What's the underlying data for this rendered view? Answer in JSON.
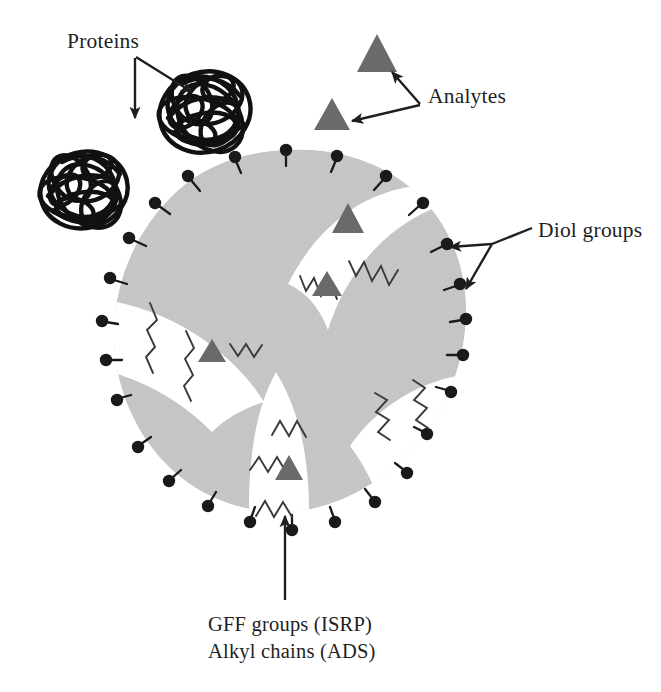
{
  "figure": {
    "background_color": "#ffffff"
  },
  "labels": {
    "proteins": "Proteins",
    "analytes": "Analytes",
    "diol_groups": "Diol groups",
    "gff_groups": "GFF groups (ISRP)",
    "alkyl_chains": "Alkyl chains (ADS)"
  },
  "colors": {
    "particle_body": "#c6c6c6",
    "pore_interior": "#ffffff",
    "diol_dot": "#1a1a1a",
    "analyte_triangle": "#6a6a6a",
    "protein_scribble": "#111111",
    "chain_stroke": "#3a3a3a",
    "arrow": "#1f1f1f",
    "text": "#1f1f1f"
  },
  "legend_items": [
    {
      "name": "proteins",
      "label": "Proteins",
      "glyph": "black tangled scribble",
      "meaning": "large excluded biomolecules"
    },
    {
      "name": "analytes",
      "label": "Analytes",
      "glyph": "gray filled triangle",
      "meaning": "small target molecules"
    },
    {
      "name": "diol-groups",
      "label": "Diol groups",
      "glyph": "black dot on stem",
      "meaning": "hydrophilic outer surface"
    },
    {
      "name": "gff-groups",
      "label": "GFF groups (ISRP)",
      "glyph": "zigzag chain",
      "meaning": "internal surface reversed phase"
    },
    {
      "name": "alkyl-chains",
      "label": "Alkyl chains (ADS)",
      "glyph": "zigzag chain",
      "meaning": "alkyl diol silica interior"
    }
  ],
  "counts": {
    "proteins": 2,
    "free_analytes": 2,
    "bound_analytes": 4,
    "diol_groups": 26,
    "pores": 4
  }
}
